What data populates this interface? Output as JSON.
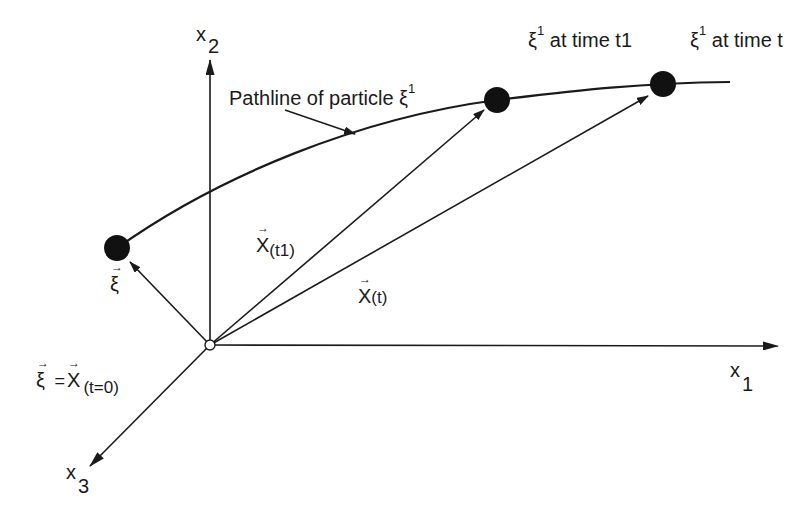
{
  "diagram": {
    "axes": {
      "x1": {
        "symbol": "x",
        "index": "1"
      },
      "x2": {
        "symbol": "x",
        "index": "2"
      },
      "x3": {
        "symbol": "x",
        "index": "3"
      }
    },
    "pathline_label": "Pathline of particle ξ",
    "pathline_superscript": "1",
    "particles": [
      {
        "symbol": "ξ",
        "superscript": "1",
        "text": "at time t1"
      },
      {
        "symbol": "ξ",
        "superscript": "1",
        "text": "at time t"
      }
    ],
    "vectors": {
      "xi": {
        "symbol": "ξ",
        "arrow": "→"
      },
      "x_t1": {
        "symbol": "X",
        "arrow": "→",
        "subscript": "(t1)"
      },
      "x_t": {
        "symbol": "X",
        "arrow": "→",
        "subscript": "(t)"
      }
    },
    "initial_condition": {
      "lhs": "ξ",
      "equals": "=",
      "rhs": "X",
      "subscript": "(t=0)",
      "arrow": "→"
    },
    "colors": {
      "stroke": "#1a1a1a",
      "background": "#ffffff"
    }
  }
}
